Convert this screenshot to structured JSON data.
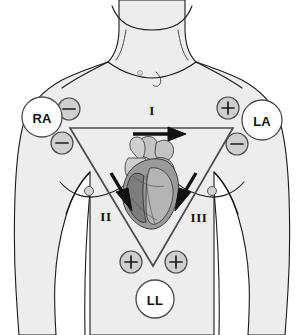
{
  "diagram": {
    "background_color": "#ffffff",
    "body_fill_color": "#ededed",
    "body_outline_color": "#1a1a1a",
    "triangle_color": "#4d4d4d",
    "electrode_fill_color": "#ffffff",
    "polarity_fill_color": "#cfcfcf",
    "arrow_color": "#111111"
  },
  "electrodes": [
    {
      "id": "RA",
      "label": "RA",
      "name": "right-arm-electrode",
      "cx": 42,
      "cy": 117,
      "r": 20
    },
    {
      "id": "LA",
      "label": "LA",
      "name": "left-arm-electrode",
      "cx": 262,
      "cy": 120,
      "r": 20
    },
    {
      "id": "LL",
      "label": "LL",
      "name": "left-leg-electrode",
      "cx": 155,
      "cy": 299,
      "r": 19
    }
  ],
  "polarity_markers": [
    {
      "id": "ra-lead1-neg",
      "symbol": "minus",
      "label": "−",
      "lead": "I",
      "electrode": "RA",
      "cx": 69,
      "cy": 109,
      "r": 11
    },
    {
      "id": "ra-lead2-neg",
      "symbol": "minus",
      "label": "−",
      "lead": "II",
      "electrode": "RA",
      "cx": 62,
      "cy": 143,
      "r": 11
    },
    {
      "id": "la-lead1-pos",
      "symbol": "plus",
      "label": "+",
      "lead": "I",
      "electrode": "LA",
      "cx": 228,
      "cy": 108,
      "r": 11
    },
    {
      "id": "la-lead3-neg",
      "symbol": "minus",
      "label": "−",
      "lead": "III",
      "electrode": "LA",
      "cx": 237,
      "cy": 144,
      "r": 11
    },
    {
      "id": "ll-lead2-pos",
      "symbol": "plus",
      "label": "+",
      "lead": "II",
      "electrode": "LL",
      "cx": 131,
      "cy": 262,
      "r": 11
    },
    {
      "id": "ll-lead3-pos",
      "symbol": "plus",
      "label": "+",
      "lead": "III",
      "electrode": "LL",
      "cx": 176,
      "cy": 262,
      "r": 11
    }
  ],
  "leads": [
    {
      "id": "lead-1",
      "label": "I",
      "name": "lead-one-label",
      "x": 152,
      "y": 110,
      "direction": "RA to LA, rightward",
      "negative": "RA",
      "positive": "LA"
    },
    {
      "id": "lead-2",
      "label": "II",
      "name": "lead-two-label",
      "x": 106,
      "y": 216,
      "direction": "RA to LL, down-right",
      "negative": "RA",
      "positive": "LL"
    },
    {
      "id": "lead-3",
      "label": "III",
      "name": "lead-three-label",
      "x": 199,
      "y": 217,
      "direction": "LA to LL, down-left",
      "negative": "LA",
      "positive": "LL"
    }
  ],
  "triangle": {
    "name": "einthoven-triangle",
    "vertices": [
      {
        "id": "top-left",
        "x": 70,
        "y": 128
      },
      {
        "id": "top-right",
        "x": 233,
        "y": 128
      },
      {
        "id": "apex",
        "x": 153,
        "y": 266
      }
    ]
  },
  "anatomy": {
    "heart_label": "heart-illustration",
    "nipple_markers": [
      {
        "id": "left-nipple",
        "cx": 89,
        "cy": 191,
        "r": 4.5
      },
      {
        "id": "right-nipple",
        "cx": 212,
        "cy": 191,
        "r": 4.5
      }
    ]
  }
}
